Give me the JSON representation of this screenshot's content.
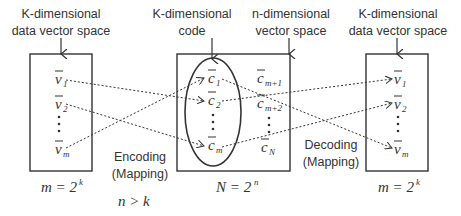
{
  "left_space": {
    "title_line1": "K-dimensional",
    "title_line2": "data vector space",
    "items": [
      "v",
      "v",
      "v"
    ],
    "subs": [
      "1",
      "2",
      "m"
    ],
    "size_formula_lhs": "m = 2",
    "size_formula_exp": "k"
  },
  "middle_space": {
    "code_title_line1": "K-dimensional",
    "code_title_line2": "code",
    "space_title_line1": "n-dimensional",
    "space_title_line2": "vector space",
    "code_items": [
      "c",
      "c",
      "c"
    ],
    "code_subs": [
      "1",
      "2",
      "m"
    ],
    "other_items": [
      "c",
      "c",
      "c"
    ],
    "other_subs": [
      "m+1",
      "m+2",
      "N"
    ],
    "size_formula_lhs": "N = 2",
    "size_formula_exp": "n"
  },
  "right_space": {
    "title_line1": "K-dimensional",
    "title_line2": "data vector space",
    "items": [
      "v",
      "v",
      "v"
    ],
    "subs": [
      "1",
      "2",
      "m"
    ],
    "size_formula_lhs": "m = 2",
    "size_formula_exp": "k"
  },
  "encoding": {
    "line1": "Encoding",
    "line2": "(Mapping)"
  },
  "decoding": {
    "line1": "Decoding",
    "line2": "(Mapping)"
  },
  "constraint": "n > k",
  "colors": {
    "stroke": "#333333",
    "background": "#ffffff"
  }
}
